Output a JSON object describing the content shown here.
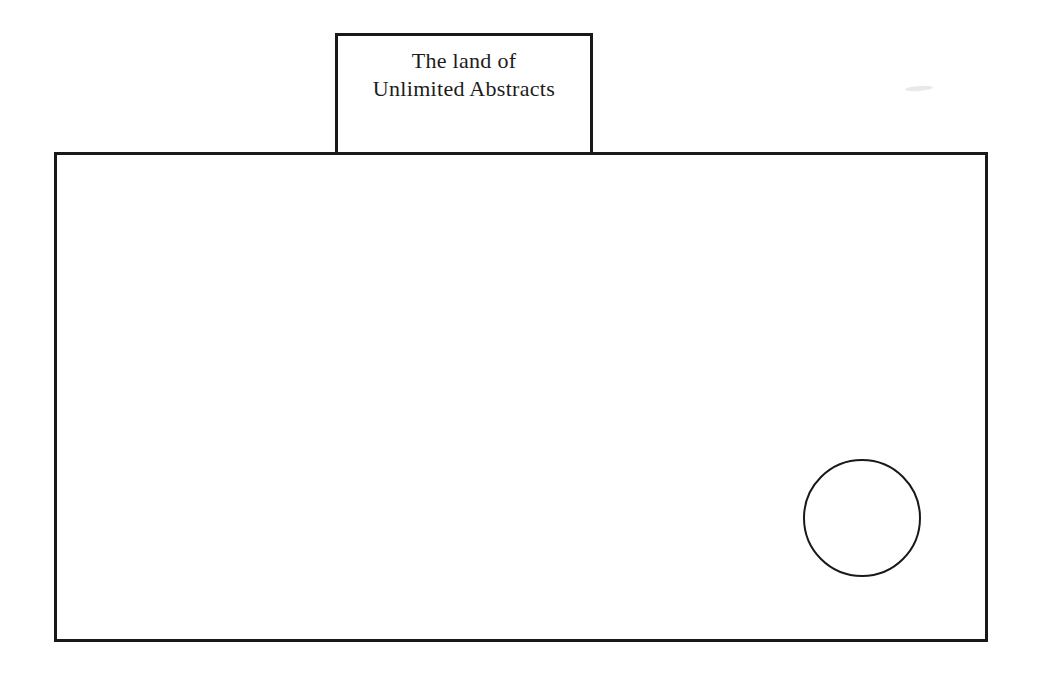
{
  "diagram": {
    "background_color": "#ffffff",
    "stroke_color": "#191919",
    "label_box": {
      "line1": "The land of",
      "line2": "Unlimited Abstracts"
    },
    "shapes": [
      {
        "name": "main-rectangle",
        "type": "rectangle"
      },
      {
        "name": "title-box",
        "type": "rectangle"
      },
      {
        "name": "circle",
        "type": "circle"
      }
    ]
  }
}
